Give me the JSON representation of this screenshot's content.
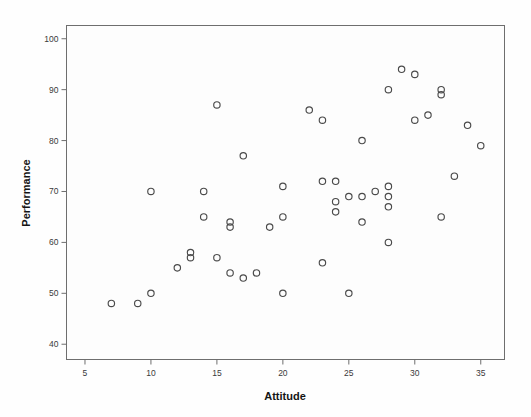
{
  "figure": {
    "kind": "scatterplot",
    "background_color": "#fefefe",
    "plot_area_color": "#fdfdfd",
    "frame_color": "#6e6e6e",
    "marker_color": "#4a4a4a",
    "marker_shape": "open-circle",
    "marker_radius_px": 3.2
  },
  "chart_data": {
    "type": "scatter",
    "title": "",
    "xlabel": "Attitude",
    "ylabel": "Performance",
    "xlim": [
      3.6,
      36.8
    ],
    "ylim": [
      37.0,
      102.6
    ],
    "xticks": [
      5,
      10,
      15,
      20,
      25,
      30,
      35
    ],
    "yticks": [
      40,
      50,
      60,
      70,
      80,
      90,
      100
    ],
    "xticklabels": [
      "5",
      "10",
      "15",
      "20",
      "25",
      "30",
      "35"
    ],
    "yticklabels": [
      "40",
      "50",
      "60",
      "70",
      "80",
      "90",
      "100"
    ],
    "grid": false,
    "legend": null,
    "n_points": 53,
    "series": [
      {
        "name": "cases",
        "x": [
          7,
          9,
          10,
          10,
          12,
          13,
          13,
          14,
          14,
          15,
          15,
          16,
          16,
          16,
          17,
          17,
          18,
          19,
          20,
          20,
          20,
          22,
          23,
          23,
          23,
          24,
          24,
          24,
          25,
          25,
          26,
          26,
          26,
          27,
          28,
          28,
          28,
          28,
          28,
          29,
          29,
          30,
          30,
          31,
          32,
          32,
          32,
          33,
          34,
          35,
          25,
          21,
          31
        ],
        "y": [
          48,
          48,
          50,
          70,
          55,
          57,
          58,
          65,
          70,
          57,
          87,
          63,
          64,
          54,
          53,
          77,
          54,
          63,
          50,
          65,
          71,
          86,
          56,
          72,
          84,
          66,
          68,
          72,
          50,
          69,
          64,
          69,
          80,
          70,
          60,
          67,
          69,
          71,
          90,
          70,
          94,
          84,
          93,
          85,
          65,
          89,
          90,
          73,
          83,
          79,
          69,
          85,
          84
        ]
      }
    ],
    "points": [
      {
        "x": 7,
        "y": 48
      },
      {
        "x": 9,
        "y": 48
      },
      {
        "x": 10,
        "y": 50
      },
      {
        "x": 10,
        "y": 70
      },
      {
        "x": 12,
        "y": 55
      },
      {
        "x": 13,
        "y": 57
      },
      {
        "x": 13,
        "y": 58
      },
      {
        "x": 14,
        "y": 65
      },
      {
        "x": 14,
        "y": 70
      },
      {
        "x": 15,
        "y": 57
      },
      {
        "x": 15,
        "y": 87
      },
      {
        "x": 16,
        "y": 63
      },
      {
        "x": 16,
        "y": 64
      },
      {
        "x": 16,
        "y": 54
      },
      {
        "x": 17,
        "y": 53
      },
      {
        "x": 17,
        "y": 77
      },
      {
        "x": 18,
        "y": 54
      },
      {
        "x": 19,
        "y": 63
      },
      {
        "x": 20,
        "y": 50
      },
      {
        "x": 20,
        "y": 65
      },
      {
        "x": 20,
        "y": 71
      },
      {
        "x": 22,
        "y": 86
      },
      {
        "x": 23,
        "y": 56
      },
      {
        "x": 23,
        "y": 72
      },
      {
        "x": 23,
        "y": 84
      },
      {
        "x": 24,
        "y": 66
      },
      {
        "x": 24,
        "y": 68
      },
      {
        "x": 24,
        "y": 72
      },
      {
        "x": 25,
        "y": 50
      },
      {
        "x": 25,
        "y": 69
      },
      {
        "x": 26,
        "y": 64
      },
      {
        "x": 26,
        "y": 69
      },
      {
        "x": 26,
        "y": 80
      },
      {
        "x": 27,
        "y": 70
      },
      {
        "x": 28,
        "y": 60
      },
      {
        "x": 28,
        "y": 67
      },
      {
        "x": 28,
        "y": 69
      },
      {
        "x": 28,
        "y": 71
      },
      {
        "x": 28,
        "y": 90
      },
      {
        "x": 29,
        "y": 94
      },
      {
        "x": 30,
        "y": 84
      },
      {
        "x": 30,
        "y": 93
      },
      {
        "x": 31,
        "y": 85
      },
      {
        "x": 32,
        "y": 65
      },
      {
        "x": 32,
        "y": 89
      },
      {
        "x": 32,
        "y": 90
      },
      {
        "x": 33,
        "y": 73
      },
      {
        "x": 34,
        "y": 83
      },
      {
        "x": 35,
        "y": 79
      }
    ]
  }
}
